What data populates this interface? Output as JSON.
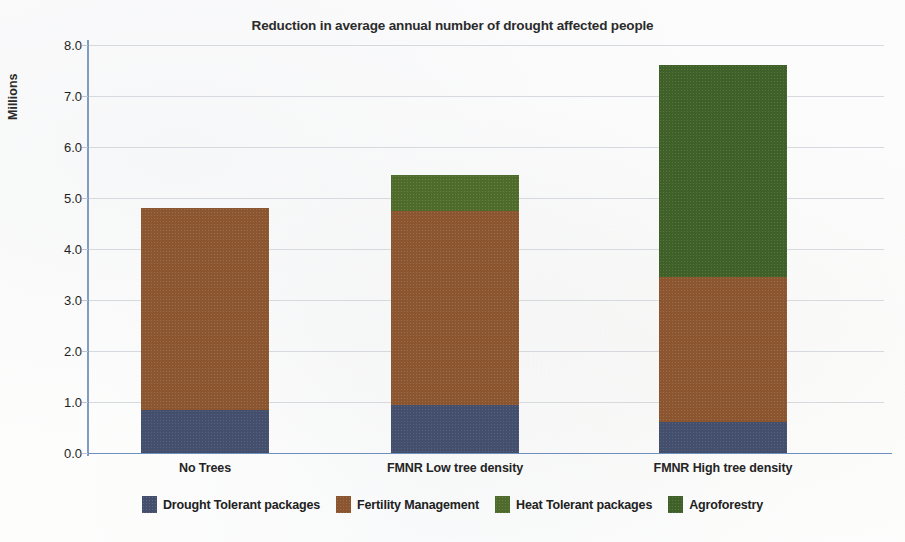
{
  "chart_data": {
    "type": "bar",
    "title": "Reduction in average annual number of drought affected people",
    "xlabel": "",
    "ylabel": "Millions",
    "ylim": [
      0.0,
      8.0
    ],
    "ytick_labels": [
      "0.0",
      "1.0",
      "2.0",
      "3.0",
      "4.0",
      "5.0",
      "6.0",
      "7.0",
      "8.0"
    ],
    "ytick_values": [
      0.0,
      1.0,
      2.0,
      3.0,
      4.0,
      5.0,
      6.0,
      7.0,
      8.0
    ],
    "grid": true,
    "stacked": true,
    "legend_position": "bottom",
    "categories": [
      "No Trees",
      "FMNR Low tree density",
      "FMNR High tree density"
    ],
    "series": [
      {
        "name": "Drought Tolerant packages",
        "color": "#434f6d",
        "values": [
          0.85,
          0.95,
          0.6
        ]
      },
      {
        "name": "Fertility Management",
        "color": "#8b5530",
        "values": [
          3.95,
          3.8,
          2.85
        ]
      },
      {
        "name": "Heat Tolerant packages",
        "color": "#4e6b2c",
        "values": [
          0,
          0.7,
          0
        ]
      },
      {
        "name": "Agroforestry",
        "color": "#3f6129",
        "values": [
          0,
          0,
          4.15
        ]
      }
    ],
    "totals": [
      4.8,
      5.45,
      7.6
    ]
  },
  "axis": {
    "y_title": "Millions"
  },
  "legend": {
    "items": [
      {
        "label": "Drought Tolerant packages",
        "color": "#434f6d",
        "swatch": "legend-swatch-drought-tolerant"
      },
      {
        "label": "Fertility Management",
        "color": "#8b5530",
        "swatch": "legend-swatch-fertility-management"
      },
      {
        "label": "Heat Tolerant packages",
        "color": "#4e6b2c",
        "swatch": "legend-swatch-heat-tolerant"
      },
      {
        "label": "Agroforestry",
        "color": "#3f6129",
        "swatch": "legend-swatch-agroforestry"
      }
    ]
  }
}
